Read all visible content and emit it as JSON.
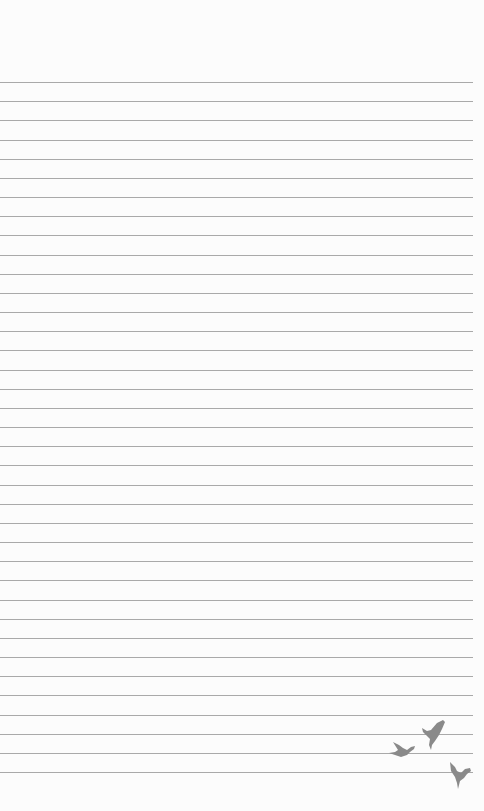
{
  "page": {
    "type": "lined-notepaper",
    "background_color": "#fcfcfc",
    "line_color": "#a9a9a9",
    "line_count": 37,
    "first_line_y": 82,
    "line_spacing": 19.17,
    "line_right_edge": 473
  },
  "decoration": {
    "icon": "birds-icon",
    "count": 3,
    "color": "#8a8a8a"
  }
}
